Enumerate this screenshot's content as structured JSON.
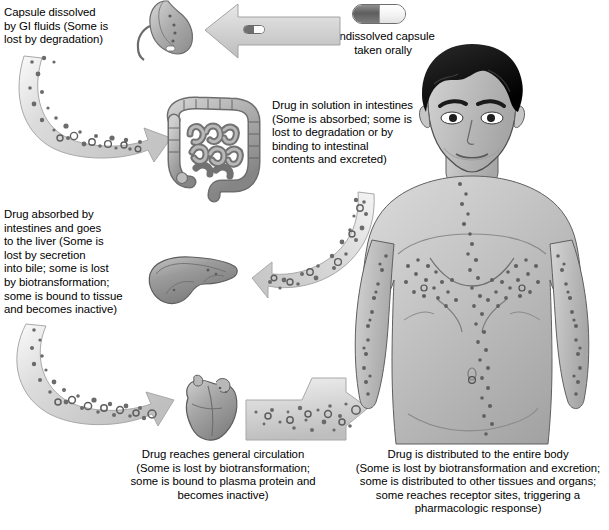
{
  "diagram": {
    "background": "#ffffff",
    "text_color": "#000000",
    "arrow_fill": "#d8d8d8",
    "arrow_stroke": "#9a9a9a",
    "particle_color": "#6b6b6b",
    "organ_fill": "#b3b3b3",
    "organ_stroke": "#5a5a5a",
    "capsule_dark": "#6e6e6e",
    "capsule_light": "#ffffff"
  },
  "labels": {
    "capsule_dissolved": "Capsule dissolved\nby GI fluids (Some is\nlost by degradation)",
    "undissolved_capsule": "Undissolved capsule\ntaken orally",
    "drug_in_solution": "Drug in solution in intestines\n(Some is absorbed; some is\nlost to degradation or by\nbinding to intestinal\ncontents and excreted)",
    "drug_absorbed_liver": "Drug absorbed by\nintestines and goes\nto the liver (Some is\nlost by secretion\ninto bile; some is lost\nby biotransformation;\nsome is bound to tissue\nand becomes inactive)",
    "general_circulation": "Drug reaches general circulation\n(Some is lost by biotransformation;\nsome is bound to plasma protein and\nbecomes inactive)",
    "entire_body": "Drug is distributed to the entire body\n(Some is lost by biotransformation and excretion;\nsome is distributed to other tissues and organs;\nsome reaches receptor sites, triggering a\npharmacologic response)"
  },
  "organs": {
    "stomach": "stomach",
    "intestines": "intestines",
    "liver": "liver",
    "heart": "heart",
    "body": "human-male-torso"
  },
  "icons": {
    "capsule": "capsule-icon",
    "stomach": "stomach-icon",
    "intestines": "intestines-icon",
    "liver": "liver-icon",
    "heart": "heart-icon",
    "body": "human-body-icon",
    "arrow_oral": "arrow-left-icon",
    "arrow_stomach_to_intestines": "curved-arrow-icon",
    "arrow_intestines_to_liver": "curved-arrow-icon",
    "arrow_liver_to_heart": "curved-arrow-icon",
    "arrow_heart_to_body": "arrow-right-icon"
  }
}
